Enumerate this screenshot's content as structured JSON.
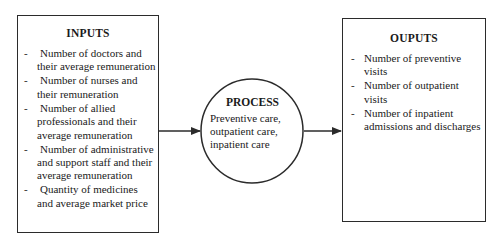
{
  "inputs": {
    "title": "INPUTS",
    "items": [
      "Number of doctors and their average remuneration",
      "Number of nurses and their remuneration",
      "Number of allied professionals and their average remuneration",
      "Number of administrative and support staff and their average remuneration",
      "Quantity of medicines and average market price"
    ]
  },
  "process": {
    "title": "PROCESS",
    "description": "Preventive care, outpatient care, inpatient care"
  },
  "outputs": {
    "title": "OUPUTS",
    "items": [
      "Number of preventive visits",
      "Number of outpatient visits",
      "Number of inpatient admissions and discharges"
    ]
  },
  "bullet": "-",
  "colors": {
    "line": "#2b2b2b",
    "text": "#1a1a1a",
    "background": "#ffffff"
  }
}
